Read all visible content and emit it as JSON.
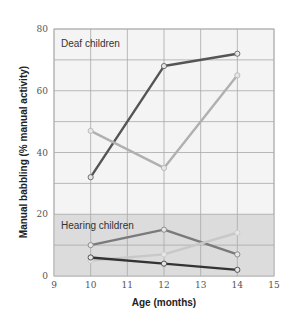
{
  "chart_data": {
    "type": "line",
    "title": "",
    "xlabel": "Age (months)",
    "ylabel": "Manual babbling (% manual activity)",
    "xlim": [
      9,
      15
    ],
    "ylim": [
      0,
      80
    ],
    "x_ticks": [
      9,
      10,
      11,
      12,
      13,
      14,
      15
    ],
    "y_ticks": [
      0,
      20,
      40,
      60,
      80
    ],
    "grid": true,
    "annotations": [
      "Deaf children",
      "Hearing children"
    ],
    "shaded_region": {
      "y_from": 0,
      "y_to": 20,
      "label": "Hearing children"
    },
    "x": [
      10,
      12,
      14
    ],
    "series": [
      {
        "name": "Deaf child 1",
        "group": "Deaf children",
        "color": "#555555",
        "values": [
          32,
          68,
          72
        ]
      },
      {
        "name": "Deaf child 2",
        "group": "Deaf children",
        "color": "#b0b0b0",
        "values": [
          47,
          35,
          65
        ]
      },
      {
        "name": "Hearing child 1",
        "group": "Hearing children",
        "color": "#7a7a7a",
        "values": [
          10,
          15,
          7
        ]
      },
      {
        "name": "Hearing child 2",
        "group": "Hearing children",
        "color": "#c8c8c8",
        "values": [
          5,
          7,
          14
        ]
      },
      {
        "name": "Hearing child 3",
        "group": "Hearing children",
        "color": "#333333",
        "values": [
          6,
          4,
          2
        ]
      }
    ]
  }
}
